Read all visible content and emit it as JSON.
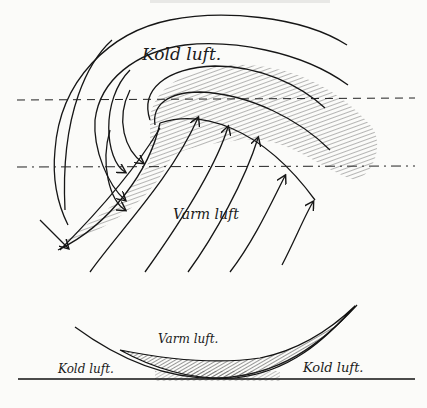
{
  "header": {
    "cropped_caption": ""
  },
  "top_diagram": {
    "labels": {
      "cold_air": "Kold luft.",
      "warm_air": "Varm luft"
    }
  },
  "cross_section": {
    "labels": {
      "warm_air": "Varm luft.",
      "cold_air_left": "Kold luft.",
      "cold_air_right": "Kold luft."
    }
  },
  "colors": {
    "ink": "#161616",
    "paper": "#fbfbf9",
    "hatch": "#555555"
  }
}
